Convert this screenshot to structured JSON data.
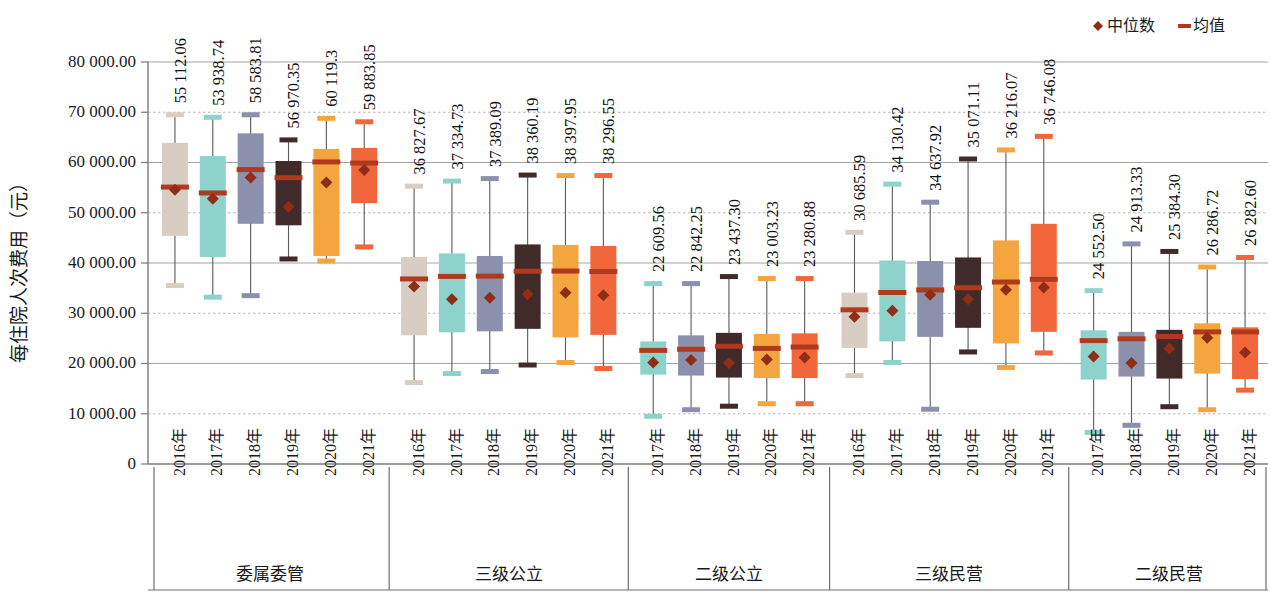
{
  "legend": {
    "position": "top-right",
    "items": [
      {
        "label": "中位数",
        "marker": "diamond",
        "color": "#8f2d16",
        "icon": "diamond-marker-icon"
      },
      {
        "label": "均值",
        "marker": "dash",
        "color": "#b03a1e",
        "icon": "dash-marker-icon"
      }
    ]
  },
  "axes": {
    "ylabel": "每住院人次费用（元）",
    "yticks": [
      "0",
      "10 000.00",
      "20 000.00",
      "30 000.00",
      "40 000.00",
      "50 000.00",
      "60 000.00",
      "70 000.00",
      "80 000.00"
    ],
    "ylim": [
      0,
      80000
    ]
  },
  "chart_data": {
    "type": "box",
    "title": "",
    "xlabel": "",
    "ylabel": "每住院人次费用（元）",
    "ylim": [
      0,
      80000
    ],
    "ytick_values": [
      0,
      10000,
      20000,
      30000,
      40000,
      50000,
      60000,
      70000,
      80000
    ],
    "grid": true,
    "legend": [
      "中位数",
      "均值"
    ],
    "series_colors": {
      "2016年": "#d8cdc2",
      "2017年": "#8ed3cb",
      "2018年": "#8b90ad",
      "2019年": "#402a2a",
      "2020年": "#f5a540",
      "2021年": "#f1663a"
    },
    "groups": [
      {
        "name": "委属委管",
        "boxes": [
          {
            "year": "2016年",
            "color": "#d8cdc2",
            "label": "55 112.06",
            "mean": 55112.06,
            "median": 54600,
            "q1": 45400,
            "q3": 63900,
            "min": 35600,
            "max": 69400
          },
          {
            "year": "2017年",
            "color": "#8ed3cb",
            "label": "53 938.74",
            "mean": 53938.74,
            "median": 52800,
            "q1": 41200,
            "q3": 61300,
            "min": 33300,
            "max": 68900
          },
          {
            "year": "2018年",
            "color": "#8b90ad",
            "label": "58 583.81",
            "mean": 58583.81,
            "median": 57000,
            "q1": 47800,
            "q3": 65800,
            "min": 33600,
            "max": 69400
          },
          {
            "year": "2019年",
            "color": "#402a2a",
            "label": "56 970.35",
            "mean": 56970.35,
            "median": 51200,
            "q1": 47500,
            "q3": 60300,
            "min": 40900,
            "max": 64400
          },
          {
            "year": "2020年",
            "color": "#f5a540",
            "label": "60 119.3",
            "mean": 60119.3,
            "median": 56000,
            "q1": 41400,
            "q3": 62700,
            "min": 40500,
            "max": 68700
          },
          {
            "year": "2021年",
            "color": "#f1663a",
            "label": "59 883.85",
            "mean": 59883.85,
            "median": 58500,
            "q1": 51900,
            "q3": 62900,
            "min": 43300,
            "max": 68000
          }
        ]
      },
      {
        "name": "三级公立",
        "boxes": [
          {
            "year": "2016年",
            "color": "#d8cdc2",
            "label": "36 827.67",
            "mean": 36827.67,
            "median": 35300,
            "q1": 25600,
            "q3": 41200,
            "min": 16300,
            "max": 55200
          },
          {
            "year": "2017年",
            "color": "#8ed3cb",
            "label": "37 334.73",
            "mean": 37334.73,
            "median": 32800,
            "q1": 26200,
            "q3": 41900,
            "min": 18100,
            "max": 56200
          },
          {
            "year": "2018年",
            "color": "#8b90ad",
            "label": "37 389.09",
            "mean": 37389.09,
            "median": 33100,
            "q1": 26400,
            "q3": 41400,
            "min": 18500,
            "max": 56700
          },
          {
            "year": "2019年",
            "color": "#402a2a",
            "label": "38 360.19",
            "mean": 38360.19,
            "median": 33800,
            "q1": 26900,
            "q3": 43700,
            "min": 19800,
            "max": 57400
          },
          {
            "year": "2020年",
            "color": "#f5a540",
            "label": "38 397.95",
            "mean": 38397.95,
            "median": 34100,
            "q1": 25200,
            "q3": 43600,
            "min": 20300,
            "max": 57300
          },
          {
            "year": "2021年",
            "color": "#f1663a",
            "label": "38 296.55",
            "mean": 38296.55,
            "median": 33600,
            "q1": 25700,
            "q3": 43400,
            "min": 19100,
            "max": 57300
          }
        ]
      },
      {
        "name": "二级公立",
        "boxes": [
          {
            "year": "2017年",
            "color": "#8ed3cb",
            "label": "22 609.56",
            "mean": 22609.56,
            "median": 20200,
            "q1": 17800,
            "q3": 24400,
            "min": 9600,
            "max": 35800
          },
          {
            "year": "2018年",
            "color": "#8b90ad",
            "label": "22 842.25",
            "mean": 22842.25,
            "median": 20700,
            "q1": 17600,
            "q3": 25600,
            "min": 10900,
            "max": 35800
          },
          {
            "year": "2019年",
            "color": "#402a2a",
            "label": "23 437.30",
            "mean": 23437.3,
            "median": 20100,
            "q1": 17200,
            "q3": 26100,
            "min": 11600,
            "max": 37200
          },
          {
            "year": "2020年",
            "color": "#f5a540",
            "label": "23 003.23",
            "mean": 23003.23,
            "median": 20800,
            "q1": 17100,
            "q3": 25900,
            "min": 12100,
            "max": 36800
          },
          {
            "year": "2021年",
            "color": "#f1663a",
            "label": "23 280.88",
            "mean": 23280.88,
            "median": 21200,
            "q1": 17100,
            "q3": 26000,
            "min": 12100,
            "max": 36800
          }
        ]
      },
      {
        "name": "三级民营",
        "boxes": [
          {
            "year": "2016年",
            "color": "#d8cdc2",
            "label": "30 685.59",
            "mean": 30685.59,
            "median": 29300,
            "q1": 23100,
            "q3": 34100,
            "min": 17700,
            "max": 46000
          },
          {
            "year": "2017年",
            "color": "#8ed3cb",
            "label": "34 130.42",
            "mean": 34130.42,
            "median": 30500,
            "q1": 24400,
            "q3": 40500,
            "min": 20300,
            "max": 55600
          },
          {
            "year": "2018年",
            "color": "#8b90ad",
            "label": "34 637.92",
            "mean": 34637.92,
            "median": 33700,
            "q1": 25300,
            "q3": 40400,
            "min": 11000,
            "max": 52000
          },
          {
            "year": "2019年",
            "color": "#402a2a",
            "label": "35 071.11",
            "mean": 35071.11,
            "median": 32800,
            "q1": 27100,
            "q3": 41100,
            "min": 22400,
            "max": 60600
          },
          {
            "year": "2020年",
            "color": "#f5a540",
            "label": "36 216.07",
            "mean": 36216.07,
            "median": 34700,
            "q1": 24000,
            "q3": 44500,
            "min": 19300,
            "max": 62400
          },
          {
            "year": "2021年",
            "color": "#f1663a",
            "label": "36 746.08",
            "mean": 36746.08,
            "median": 35100,
            "q1": 26300,
            "q3": 47800,
            "min": 22200,
            "max": 65100
          }
        ]
      },
      {
        "name": "二级民营",
        "boxes": [
          {
            "year": "2017年",
            "color": "#8ed3cb",
            "label": "24 552.50",
            "mean": 24552.5,
            "median": 21400,
            "q1": 16800,
            "q3": 26600,
            "min": 6400,
            "max": 34400
          },
          {
            "year": "2018年",
            "color": "#8b90ad",
            "label": "24 913.33",
            "mean": 24913.33,
            "median": 20100,
            "q1": 17400,
            "q3": 26300,
            "min": 7800,
            "max": 43700
          },
          {
            "year": "2019年",
            "color": "#402a2a",
            "label": "25 384.30",
            "mean": 25384.3,
            "median": 23000,
            "q1": 17000,
            "q3": 26700,
            "min": 11500,
            "max": 42200
          },
          {
            "year": "2020年",
            "color": "#f5a540",
            "label": "26 286.72",
            "mean": 26286.72,
            "median": 25100,
            "q1": 18000,
            "q3": 28000,
            "min": 10900,
            "max": 39100
          },
          {
            "year": "2021年",
            "color": "#f1663a",
            "label": "26 282.60",
            "mean": 26282.6,
            "median": 22200,
            "q1": 16900,
            "q3": 27200,
            "min": 14800,
            "max": 41000
          }
        ]
      }
    ]
  }
}
